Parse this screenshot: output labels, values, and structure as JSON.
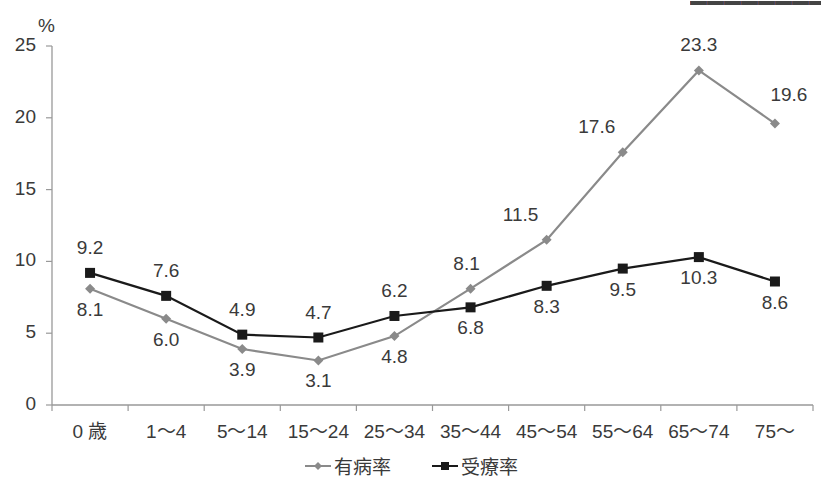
{
  "chart_data": {
    "type": "line",
    "title": "",
    "ylabel": "%",
    "xlabel": "",
    "ylim": [
      0,
      25
    ],
    "yticks": [
      0,
      5,
      10,
      15,
      20,
      25
    ],
    "grid": false,
    "legend_position": "bottom",
    "categories": [
      "0 歳",
      "1〜4",
      "5〜14",
      "15〜24",
      "25〜34",
      "35〜44",
      "45〜54",
      "55〜64",
      "65〜74",
      "75〜"
    ],
    "series": [
      {
        "name": "有病率",
        "color": "#8a8a8a",
        "marker": "diamond",
        "values": [
          8.1,
          6.0,
          3.9,
          3.1,
          4.8,
          8.1,
          11.5,
          17.6,
          23.3,
          19.6
        ],
        "label_positions": [
          "below",
          "below",
          "below",
          "below",
          "below",
          "above",
          "above",
          "above",
          "above",
          "above"
        ]
      },
      {
        "name": "受療率",
        "color": "#1a1a1a",
        "marker": "square",
        "values": [
          9.2,
          7.6,
          4.9,
          4.7,
          6.2,
          6.8,
          8.3,
          9.5,
          10.3,
          8.6
        ],
        "label_positions": [
          "above",
          "above",
          "above",
          "above",
          "above",
          "below",
          "below",
          "below",
          "below",
          "below"
        ]
      }
    ]
  },
  "axis": {
    "unit": "%",
    "y_tick_labels": [
      "0",
      "5",
      "10",
      "15",
      "20",
      "25"
    ]
  },
  "legend": {
    "items": [
      {
        "label": "有病率"
      },
      {
        "label": "受療率"
      }
    ]
  }
}
